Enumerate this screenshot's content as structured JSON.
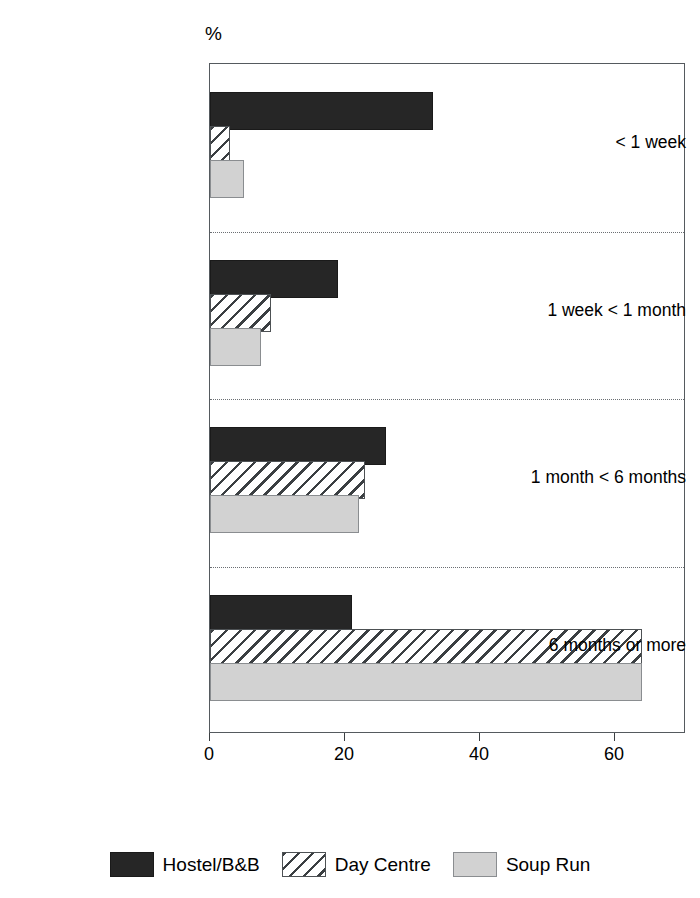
{
  "chart_data": {
    "type": "bar",
    "orientation": "horizontal",
    "title": "",
    "subtitle": "",
    "xlabel": "",
    "ylabel": "",
    "unit_label": "%",
    "categories": [
      "< 1 week",
      "1 week < 1 month",
      "1 month < 6 months",
      "6 months or more"
    ],
    "series": [
      {
        "name": "Hostel/B&B",
        "values": [
          33,
          19,
          26,
          21
        ]
      },
      {
        "name": "Day Centre",
        "values": [
          3,
          9,
          23,
          64
        ]
      },
      {
        "name": "Soup Run",
        "values": [
          5,
          7.5,
          22,
          64
        ]
      }
    ],
    "xlim": [
      0,
      70
    ],
    "xticks": [
      0,
      20,
      40,
      60
    ],
    "xtick_labels": [
      "0",
      "20",
      "40",
      "60"
    ],
    "grid": false,
    "group_separators": true,
    "legend_position": "bottom",
    "colors": {
      "hostel": "#262626",
      "day_centre": "#ffffff",
      "soup_run": "#d2d2d2",
      "hatch_stroke": "#3b3f42",
      "axis": "#555a5e",
      "separator": "#6b6f73"
    }
  },
  "legend": {
    "items": [
      {
        "label": "Hostel/B&B",
        "swatch": "solid-dark-swatch"
      },
      {
        "label": "Day Centre",
        "swatch": "diagonal-hatch-swatch"
      },
      {
        "label": "Soup Run",
        "swatch": "light-grey-swatch"
      }
    ]
  }
}
